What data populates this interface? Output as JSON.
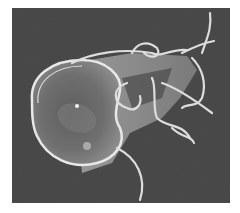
{
  "image": {
    "subject": "Scanning electron micrograph of a flagellated protozoan (Giardia trophozoite) on a dark textured surface",
    "colors": {
      "background": "#3c3c3c",
      "cell_body": "#8a8a8a",
      "ventral_disc": "#6e6e6e",
      "rim_highlight": "#e6e6e6",
      "flagella": "#dcdcdc"
    }
  }
}
